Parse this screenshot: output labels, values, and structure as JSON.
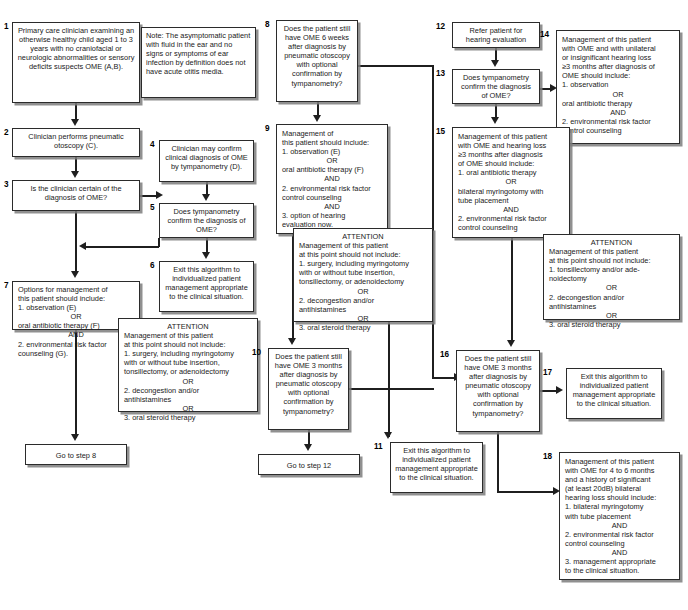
{
  "diagram": {
    "box_count": 18
  },
  "boxes": {
    "b1": {
      "num": "1",
      "text": "Primary care clinician examining an otherwise healthy child aged 1 to 3 years with no craniofacial or neurologic abnormalities or sensory deficits suspects OME (A,B)."
    },
    "note": {
      "num": "",
      "text": "Note: The asymptomatic patient with fluid in the ear and no signs or symptoms of ear infection by definition does not have acute otitis media."
    },
    "b2": {
      "num": "2",
      "text": "Clinician performs pneumatic otoscopy (C)."
    },
    "b3": {
      "num": "3",
      "text": "Is the clinician certain of the diagnosis of OME?"
    },
    "b4": {
      "num": "4",
      "text": "Clinician may confirm clinical diagnosis of OME by tympanometry (D)."
    },
    "b5": {
      "num": "5",
      "text": "Does tympanometry confirm the diagnosis of OME?"
    },
    "b6": {
      "num": "6",
      "text": "Exit this algorithm to individualized patient management appropriate to the clinical situation."
    },
    "b7": {
      "num": "7",
      "lines": [
        {
          "t": "Options for management of",
          "c": false
        },
        {
          "t": "this patient should include:",
          "c": false
        },
        {
          "t": "1. observation (E)",
          "c": false
        },
        {
          "t": "OR",
          "c": true
        },
        {
          "t": "oral antibiotic therapy (F)",
          "c": false
        },
        {
          "t": "AND",
          "c": true
        },
        {
          "t": "2. environmental risk factor",
          "c": false
        },
        {
          "t": "counseling (G).",
          "c": false
        }
      ]
    },
    "attn_left": {
      "lines": [
        {
          "t": "ATTENTION",
          "c": true
        },
        {
          "t": "Management of this patient",
          "c": false
        },
        {
          "t": "at this point should  not include:",
          "c": false
        },
        {
          "t": "1. surgery, including myringotomy",
          "c": false
        },
        {
          "t": "with or without tube insertion,",
          "c": false
        },
        {
          "t": "tonsillectomy, or adenoidectomy",
          "c": false
        },
        {
          "t": "OR",
          "c": true
        },
        {
          "t": "2. decongestion and/or",
          "c": false
        },
        {
          "t": "antihistamines",
          "c": false
        },
        {
          "t": "OR",
          "c": true
        },
        {
          "t": "3. oral steroid therapy",
          "c": false
        }
      ]
    },
    "goto8": {
      "text": "Go to step 8"
    },
    "b8": {
      "num": "8",
      "text": "Does the patient still have OME 6 weeks after diagnosis by pneumatic otoscopy with optional confirmation by tympanometry?"
    },
    "b9": {
      "num": "9",
      "lines": [
        {
          "t": "Management of",
          "c": false
        },
        {
          "t": "this patient should include:",
          "c": false
        },
        {
          "t": "1. observation (E)",
          "c": false
        },
        {
          "t": "OR",
          "c": true
        },
        {
          "t": "oral antibiotic therapy (F)",
          "c": false
        },
        {
          "t": "AND",
          "c": true
        },
        {
          "t": "2. environmental risk factor",
          "c": false
        },
        {
          "t": " control counseling",
          "c": false
        },
        {
          "t": "AND",
          "c": true
        },
        {
          "t": "3. option of  hearing",
          "c": false
        },
        {
          "t": "evaluation now.",
          "c": false
        }
      ]
    },
    "attn_mid": {
      "lines": [
        {
          "t": "ATTENTION",
          "c": true
        },
        {
          "t": "Management of this patient",
          "c": false
        },
        {
          "t": "at this point should not include:",
          "c": false
        },
        {
          "t": "1. surgery, including myringotomy",
          "c": false
        },
        {
          "t": "with or without tube insertion,",
          "c": false
        },
        {
          "t": "tonsillectomy, or adenoidectomy",
          "c": false
        },
        {
          "t": "OR",
          "c": true
        },
        {
          "t": "2. decongestion and/or",
          "c": false
        },
        {
          "t": "antihistamines",
          "c": false
        },
        {
          "t": "OR",
          "c": true
        },
        {
          "t": "3. oral steroid therapy",
          "c": false
        }
      ]
    },
    "b10": {
      "num": "10",
      "text": "Does the patient still have OME 3 months after diagnosis by pneumatic otoscopy with optional confirmation by tympanometry?"
    },
    "goto12": {
      "text": "Go to step 12"
    },
    "b11": {
      "num": "11",
      "text": "Exit this algorithm to individualized patient management appropriate to the clinical situation."
    },
    "b12": {
      "num": "12",
      "text": "Refer patient for hearing evaluation"
    },
    "b13": {
      "num": "13",
      "text": "Does tympanometry confirm the diagnosis of OME?"
    },
    "b14": {
      "num": "14",
      "lines": [
        {
          "t": "Management of this patient",
          "c": false
        },
        {
          "t": "with OME and with unilateral",
          "c": false
        },
        {
          "t": "or insignificant hearing loss",
          "c": false
        },
        {
          "t": "≥3 months after diagnosis of",
          "c": false
        },
        {
          "t": "OME should include:",
          "c": false
        },
        {
          "t": "1. observation",
          "c": false
        },
        {
          "t": "OR",
          "c": true
        },
        {
          "t": "oral antibiotic therapy",
          "c": false
        },
        {
          "t": "AND",
          "c": true
        },
        {
          "t": "2. environmental risk factor",
          "c": false
        },
        {
          "t": " control counseling",
          "c": false
        }
      ]
    },
    "b15": {
      "num": "15",
      "lines": [
        {
          "t": "Management of this patient",
          "c": false
        },
        {
          "t": "with OME and hearing loss",
          "c": false
        },
        {
          "t": "≥3 months after diagnosis",
          "c": false
        },
        {
          "t": "of OME should include:",
          "c": false
        },
        {
          "t": "1. oral antibiotic therapy",
          "c": false
        },
        {
          "t": "OR",
          "c": true
        },
        {
          "t": "bilateral myringotomy with",
          "c": false
        },
        {
          "t": "tube placement",
          "c": false
        },
        {
          "t": "AND",
          "c": true
        },
        {
          "t": "2. environmental risk factor",
          "c": false
        },
        {
          "t": " control counseling",
          "c": false
        }
      ]
    },
    "attn_right": {
      "lines": [
        {
          "t": "ATTENTION",
          "c": true
        },
        {
          "t": "Management of this patient",
          "c": false
        },
        {
          "t": "at this point should not include:",
          "c": false
        },
        {
          "t": "1. tonsillectomy and/or ade-",
          "c": false
        },
        {
          "t": "noidectomy",
          "c": false
        },
        {
          "t": "OR",
          "c": true
        },
        {
          "t": "2. decongestion and/or",
          "c": false
        },
        {
          "t": "antihistamines",
          "c": false
        },
        {
          "t": "OR",
          "c": true
        },
        {
          "t": "3. oral steroid therapy",
          "c": false
        }
      ]
    },
    "b16": {
      "num": "16",
      "text": "Does the patient still have OME 3 months after diagnosis by pneumatic otoscopy with optional confirmation by tympanometry?"
    },
    "b17": {
      "num": "17",
      "text": "Exit this algorithm to individualized patient management appropriate to the clinical situation."
    },
    "b18": {
      "num": "18",
      "lines": [
        {
          "t": "Management of this patient",
          "c": false
        },
        {
          "t": "with OME for 4 to 6 months",
          "c": false
        },
        {
          "t": "and a history of significant",
          "c": false
        },
        {
          "t": "(at least 20dB) bilateral",
          "c": false
        },
        {
          "t": "hearing loss should include:",
          "c": false
        },
        {
          "t": "1. bilateral myringotomy",
          "c": false
        },
        {
          "t": "with tube placement",
          "c": false
        },
        {
          "t": "AND",
          "c": true
        },
        {
          "t": "2. environmental risk factor",
          "c": false
        },
        {
          "t": "control counseling",
          "c": false
        },
        {
          "t": "AND",
          "c": true
        },
        {
          "t": "3. management appropriate",
          "c": false
        },
        {
          "t": "to the clinical situation.",
          "c": false
        }
      ]
    }
  }
}
